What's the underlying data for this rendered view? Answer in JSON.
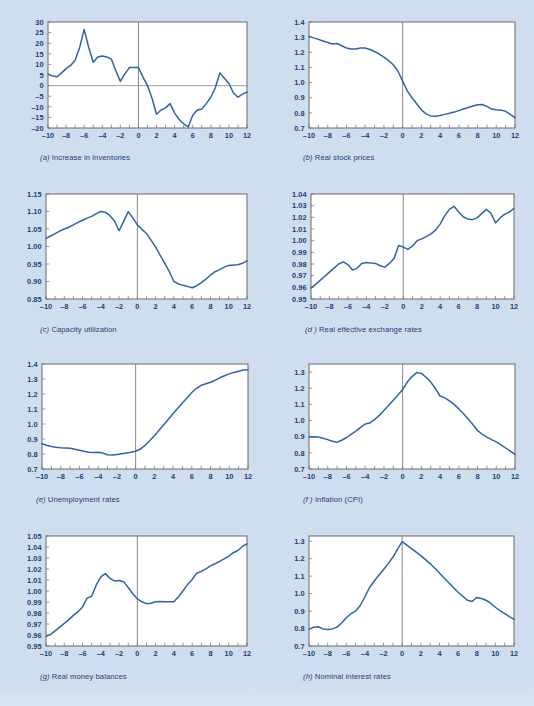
{
  "figure": {
    "background_color": "#cfdeee",
    "line_color": "#2f63ae",
    "axis_color": "#6b6b6b",
    "label_color": "#1b3f77",
    "panel_background": "#ffffff"
  },
  "chart_data": [
    {
      "type": "line",
      "panel": "a",
      "title": "Increase in inventories",
      "caption_prefix": "(a)",
      "xlabel": "",
      "ylabel": "",
      "xlim": [
        -10,
        12
      ],
      "ylim": [
        -20,
        30
      ],
      "xticks": [
        -10,
        -8,
        -6,
        -4,
        -2,
        0,
        2,
        4,
        6,
        8,
        10,
        12
      ],
      "xticklabels": [
        "–10",
        "–8",
        "–6",
        "–4",
        "–2",
        "0",
        "2",
        "4",
        "6",
        "8",
        "10",
        "12"
      ],
      "yticks": [
        -20,
        -15,
        -10,
        -5,
        0,
        5,
        10,
        15,
        20,
        25,
        30
      ],
      "yticklabels": [
        "–20",
        "–15",
        "–10",
        "–5",
        "0",
        "5",
        "10",
        "15",
        "20",
        "25",
        "30"
      ],
      "grid": false,
      "zero_line_x": 0,
      "zero_line_y": 0,
      "x": [
        -10,
        -9.5,
        -9,
        -8.5,
        -8,
        -7.5,
        -7,
        -6.5,
        -6,
        -5.5,
        -5,
        -4.5,
        -4,
        -3.5,
        -3,
        -2.5,
        -2,
        -1.5,
        -1,
        -0.5,
        0,
        0.5,
        1,
        1.5,
        2,
        2.5,
        3,
        3.5,
        4,
        4.5,
        5,
        5.5,
        6,
        6.5,
        7,
        7.5,
        8,
        8.5,
        9,
        9.5,
        10,
        10.5,
        11,
        11.5,
        12
      ],
      "values": [
        5.5,
        4.5,
        4.2,
        6.0,
        8.0,
        9.5,
        12.0,
        18.0,
        26.5,
        18.0,
        11.0,
        13.5,
        14.0,
        13.5,
        12.5,
        7.0,
        2.0,
        5.5,
        8.5,
        8.5,
        8.5,
        4.0,
        0.0,
        -6.0,
        -13.5,
        -11.5,
        -10.5,
        -8.5,
        -13.0,
        -16.0,
        -18.0,
        -19.5,
        -14.0,
        -11.5,
        -11.0,
        -8.5,
        -5.5,
        -1.0,
        6.0,
        3.5,
        1.0,
        -3.5,
        -5.5,
        -4.0,
        -3.0
      ]
    },
    {
      "type": "line",
      "panel": "b",
      "title": "Real stock prices",
      "caption_prefix": "(b)",
      "xlabel": "",
      "ylabel": "",
      "xlim": [
        -10,
        12
      ],
      "ylim": [
        0.7,
        1.4
      ],
      "xticks": [
        -10,
        -8,
        -6,
        -4,
        -2,
        0,
        2,
        4,
        6,
        8,
        10,
        12
      ],
      "xticklabels": [
        "–10",
        "–8",
        "–6",
        "–4",
        "–2",
        "0",
        "2",
        "4",
        "6",
        "8",
        "10",
        "12"
      ],
      "yticks": [
        0.7,
        0.8,
        0.9,
        1.0,
        1.1,
        1.2,
        1.3,
        1.4
      ],
      "yticklabels": [
        "0.7",
        "0.8",
        "0.9",
        "1.0",
        "1.1",
        "1.2",
        "1.3",
        "1.4"
      ],
      "grid": false,
      "zero_line_x": 0,
      "x": [
        -10,
        -9.5,
        -9,
        -8.5,
        -8,
        -7.5,
        -7,
        -6.5,
        -6,
        -5.5,
        -5,
        -4.5,
        -4,
        -3.5,
        -3,
        -2.5,
        -2,
        -1.5,
        -1,
        -0.5,
        0,
        0.5,
        1,
        1.5,
        2,
        2.5,
        3,
        3.5,
        4,
        4.5,
        5,
        5.5,
        6,
        6.5,
        7,
        7.5,
        8,
        8.5,
        9,
        9.5,
        10,
        10.5,
        11,
        11.5,
        12
      ],
      "values": [
        1.305,
        1.295,
        1.285,
        1.275,
        1.265,
        1.255,
        1.258,
        1.243,
        1.228,
        1.222,
        1.222,
        1.228,
        1.228,
        1.218,
        1.205,
        1.188,
        1.168,
        1.145,
        1.118,
        1.075,
        1.01,
        0.945,
        0.9,
        0.86,
        0.82,
        0.793,
        0.78,
        0.777,
        0.783,
        0.79,
        0.797,
        0.805,
        0.815,
        0.825,
        0.835,
        0.845,
        0.853,
        0.855,
        0.843,
        0.825,
        0.82,
        0.818,
        0.81,
        0.79,
        0.768
      ]
    },
    {
      "type": "line",
      "panel": "c",
      "title": "Capacity utilization",
      "caption_prefix": "(c)",
      "xlabel": "",
      "ylabel": "",
      "xlim": [
        -10,
        12
      ],
      "ylim": [
        0.85,
        1.15
      ],
      "xticks": [
        -10,
        -8,
        -6,
        -4,
        -2,
        0,
        2,
        4,
        6,
        8,
        10,
        12
      ],
      "xticklabels": [
        "–10",
        "–8",
        "–6",
        "–4",
        "–2",
        "0",
        "2",
        "4",
        "6",
        "8",
        "10",
        "12"
      ],
      "yticks": [
        0.85,
        0.9,
        0.95,
        1.0,
        1.05,
        1.1,
        1.15
      ],
      "yticklabels": [
        "0.85",
        "0.90",
        "0.95",
        "1.00",
        "1.05",
        "1.10",
        "1.15"
      ],
      "grid": false,
      "zero_line_x": 0,
      "x": [
        -10,
        -9.5,
        -9,
        -8.5,
        -8,
        -7.5,
        -7,
        -6.5,
        -6,
        -5.5,
        -5,
        -4.5,
        -4,
        -3.5,
        -3,
        -2.5,
        -2,
        -1.5,
        -1,
        -0.5,
        0,
        0.5,
        1,
        1.5,
        2,
        2.5,
        3,
        3.5,
        4,
        4.5,
        5,
        5.5,
        6,
        6.5,
        7,
        7.5,
        8,
        8.5,
        9,
        9.5,
        10,
        10.5,
        11,
        11.5,
        12
      ],
      "values": [
        1.023,
        1.03,
        1.037,
        1.044,
        1.05,
        1.055,
        1.062,
        1.069,
        1.075,
        1.081,
        1.086,
        1.094,
        1.1,
        1.098,
        1.088,
        1.073,
        1.045,
        1.072,
        1.0995,
        1.082,
        1.062,
        1.049,
        1.037,
        1.018,
        0.998,
        0.975,
        0.952,
        0.928,
        0.9,
        0.893,
        0.889,
        0.886,
        0.882,
        0.888,
        0.897,
        0.907,
        0.918,
        0.928,
        0.934,
        0.941,
        0.946,
        0.947,
        0.948,
        0.952,
        0.959
      ]
    },
    {
      "type": "line",
      "panel": "d",
      "title": "Real effective exchange rates",
      "caption_prefix": "(d )",
      "xlabel": "",
      "ylabel": "",
      "xlim": [
        -10,
        12
      ],
      "ylim": [
        0.95,
        1.04
      ],
      "xticks": [
        -10,
        -8,
        -6,
        -4,
        -2,
        0,
        2,
        4,
        6,
        8,
        10,
        12
      ],
      "xticklabels": [
        "–10",
        "–8",
        "–6",
        "–4",
        "–2",
        "0",
        "2",
        "4",
        "6",
        "8",
        "10",
        "12"
      ],
      "yticks": [
        0.95,
        0.96,
        0.97,
        0.98,
        0.99,
        1.0,
        1.01,
        1.02,
        1.03,
        1.04
      ],
      "yticklabels": [
        "0.95",
        "0.96",
        "0.97",
        "0.98",
        "0.99",
        "1.00",
        "1.01",
        "1.02",
        "1.03",
        "1.04"
      ],
      "grid": false,
      "zero_line_x": 0,
      "x": [
        -10,
        -9.5,
        -9,
        -8.5,
        -8,
        -7.5,
        -7,
        -6.5,
        -6,
        -5.5,
        -5,
        -4.5,
        -4,
        -3.5,
        -3,
        -2.5,
        -2,
        -1.5,
        -1,
        -0.5,
        0,
        0.5,
        1,
        1.5,
        2,
        2.5,
        3,
        3.5,
        4,
        4.5,
        5,
        5.5,
        6,
        6.5,
        7,
        7.5,
        8,
        8.5,
        9,
        9.5,
        10,
        10.5,
        11,
        11.5,
        12
      ],
      "values": [
        0.9595,
        0.9625,
        0.966,
        0.9695,
        0.973,
        0.9765,
        0.98,
        0.9818,
        0.9795,
        0.9748,
        0.9765,
        0.9805,
        0.9812,
        0.9808,
        0.9805,
        0.9785,
        0.9773,
        0.9805,
        0.9848,
        0.9958,
        0.9945,
        0.9925,
        0.9955,
        1.0,
        1.0015,
        1.0035,
        1.0058,
        1.009,
        1.0142,
        1.0215,
        1.0268,
        1.0295,
        1.0245,
        1.0205,
        1.0185,
        1.018,
        1.0195,
        1.0232,
        1.0268,
        1.0235,
        1.0152,
        1.0195,
        1.0228,
        1.0245,
        1.0278
      ]
    },
    {
      "type": "line",
      "panel": "e",
      "title": "Unemployment rates",
      "caption_prefix": "(e)",
      "xlabel": "",
      "ylabel": "",
      "xlim": [
        -10,
        12
      ],
      "ylim": [
        0.7,
        1.4
      ],
      "xticks": [
        -10,
        -8,
        -6,
        -4,
        -2,
        0,
        2,
        4,
        6,
        8,
        10,
        12
      ],
      "xticklabels": [
        "–10",
        "–8",
        "–6",
        "–4",
        "–2",
        "0",
        "2",
        "4",
        "6",
        "8",
        "10",
        "12"
      ],
      "yticks": [
        0.7,
        0.8,
        0.9,
        1.0,
        1.1,
        1.2,
        1.3,
        1.4
      ],
      "yticklabels": [
        "0.7",
        "0.8",
        "0.9",
        "1.0",
        "1.1",
        "1.2",
        "1.3",
        "1.4"
      ],
      "grid": false,
      "zero_line_x": 0,
      "x": [
        -10,
        -9.5,
        -9,
        -8.5,
        -8,
        -7.5,
        -7,
        -6.5,
        -6,
        -5.5,
        -5,
        -4.5,
        -4,
        -3.5,
        -3,
        -2.5,
        -2,
        -1.5,
        -1,
        -0.5,
        0,
        0.5,
        1,
        1.5,
        2,
        2.5,
        3,
        3.5,
        4,
        4.5,
        5,
        5.5,
        6,
        6.5,
        7,
        7.5,
        8,
        8.5,
        9,
        9.5,
        10,
        10.5,
        11,
        11.5,
        12
      ],
      "values": [
        0.868,
        0.858,
        0.85,
        0.845,
        0.842,
        0.84,
        0.838,
        0.832,
        0.825,
        0.818,
        0.812,
        0.81,
        0.812,
        0.806,
        0.795,
        0.793,
        0.797,
        0.802,
        0.807,
        0.812,
        0.818,
        0.833,
        0.858,
        0.888,
        0.922,
        0.958,
        0.995,
        1.032,
        1.07,
        1.105,
        1.14,
        1.175,
        1.21,
        1.238,
        1.258,
        1.268,
        1.278,
        1.292,
        1.308,
        1.322,
        1.334,
        1.344,
        1.352,
        1.36,
        1.362
      ]
    },
    {
      "type": "line",
      "panel": "f",
      "title": "Inflation (CPI)",
      "caption_prefix": "(f )",
      "xlabel": "",
      "ylabel": "",
      "xlim": [
        -10,
        12
      ],
      "ylim": [
        0.7,
        1.35
      ],
      "xticks": [
        -10,
        -8,
        -6,
        -4,
        -2,
        0,
        2,
        4,
        6,
        8,
        10,
        12
      ],
      "xticklabels": [
        "–10",
        "–8",
        "–6",
        "–4",
        "–2",
        "0",
        "2",
        "4",
        "6",
        "8",
        "10",
        "12"
      ],
      "yticks": [
        0.7,
        0.8,
        0.9,
        1.0,
        1.1,
        1.2,
        1.3
      ],
      "yticklabels": [
        "0.7",
        "0.8",
        "0.9",
        "1.0",
        "1.1",
        "1.2",
        "1.3"
      ],
      "grid": false,
      "zero_line_x": 0,
      "x": [
        -10,
        -9.5,
        -9,
        -8.5,
        -8,
        -7.5,
        -7,
        -6.5,
        -6,
        -5.5,
        -5,
        -4.5,
        -4,
        -3.5,
        -3,
        -2.5,
        -2,
        -1.5,
        -1,
        -0.5,
        0,
        0.5,
        1,
        1.5,
        2,
        2.5,
        3,
        3.5,
        4,
        4.5,
        5,
        5.5,
        6,
        6.5,
        7,
        7.5,
        8,
        8.5,
        9,
        9.5,
        10,
        10.5,
        11,
        11.5,
        12
      ],
      "values": [
        0.898,
        0.9,
        0.898,
        0.89,
        0.882,
        0.872,
        0.866,
        0.878,
        0.895,
        0.915,
        0.935,
        0.958,
        0.978,
        0.985,
        1.005,
        1.032,
        1.062,
        1.093,
        1.125,
        1.158,
        1.192,
        1.238,
        1.272,
        1.297,
        1.292,
        1.268,
        1.238,
        1.198,
        1.152,
        1.14,
        1.122,
        1.1,
        1.072,
        1.042,
        1.01,
        0.975,
        0.938,
        0.915,
        0.897,
        0.882,
        0.868,
        0.85,
        0.83,
        0.81,
        0.79
      ]
    },
    {
      "type": "line",
      "panel": "g",
      "title": "Real money balances",
      "caption_prefix": "(g)",
      "xlabel": "",
      "ylabel": "",
      "xlim": [
        -10,
        12
      ],
      "ylim": [
        0.95,
        1.05
      ],
      "xticks": [
        -10,
        -8,
        -6,
        -4,
        -2,
        0,
        2,
        4,
        6,
        8,
        10,
        12
      ],
      "xticklabels": [
        "–10",
        "–8",
        "–6",
        "–4",
        "–2",
        "0",
        "2",
        "4",
        "6",
        "8",
        "10",
        "12"
      ],
      "yticks": [
        0.95,
        0.96,
        0.97,
        0.98,
        0.99,
        1.0,
        1.01,
        1.02,
        1.03,
        1.04,
        1.05
      ],
      "yticklabels": [
        "0.95",
        "0.96",
        "0.97",
        "0.98",
        "0.99",
        "1.00",
        "1.01",
        "1.02",
        "1.03",
        "1.04",
        "1.05"
      ],
      "grid": false,
      "zero_line_x": 0,
      "x": [
        -10,
        -9.5,
        -9,
        -8.5,
        -8,
        -7.5,
        -7,
        -6.5,
        -6,
        -5.5,
        -5,
        -4.5,
        -4,
        -3.5,
        -3,
        -2.5,
        -2,
        -1.5,
        -1,
        -0.5,
        0,
        0.5,
        1,
        1.5,
        2,
        2.5,
        3,
        3.5,
        4,
        4.5,
        5,
        5.5,
        6,
        6.5,
        7,
        7.5,
        8,
        8.5,
        9,
        9.5,
        10,
        10.5,
        11,
        11.5,
        12
      ],
      "values": [
        0.9588,
        0.9605,
        0.9638,
        0.9672,
        0.9705,
        0.974,
        0.9778,
        0.9812,
        0.9855,
        0.9935,
        0.9952,
        1.0055,
        1.0128,
        1.0158,
        1.0115,
        1.0092,
        1.0095,
        1.0085,
        1.0032,
        0.9975,
        0.9928,
        0.9902,
        0.9885,
        0.9888,
        0.9902,
        0.9905,
        0.9902,
        0.9902,
        0.9902,
        0.9948,
        1.0002,
        1.0058,
        1.0105,
        1.0162,
        1.0178,
        1.0202,
        1.0228,
        1.0248,
        1.027,
        1.0292,
        1.0318,
        1.0348,
        1.0368,
        1.0405,
        1.0428
      ]
    },
    {
      "type": "line",
      "panel": "h",
      "title": "Nominal interest rates",
      "caption_prefix": "(h)",
      "xlabel": "",
      "ylabel": "",
      "xlim": [
        -10,
        12
      ],
      "ylim": [
        0.7,
        1.33
      ],
      "xticks": [
        -10,
        -8,
        -6,
        -4,
        -2,
        0,
        2,
        4,
        6,
        8,
        10,
        12
      ],
      "xticklabels": [
        "–10",
        "–8",
        "–6",
        "–4",
        "–2",
        "0",
        "2",
        "4",
        "6",
        "8",
        "10",
        "12"
      ],
      "yticks": [
        0.7,
        0.8,
        0.9,
        1.0,
        1.1,
        1.2,
        1.3
      ],
      "yticklabels": [
        "0.7",
        "0.8",
        "0.9",
        "1.0",
        "1.1",
        "1.2",
        "1.3"
      ],
      "grid": false,
      "zero_line_x": 0,
      "x": [
        -10,
        -9.5,
        -9,
        -8.5,
        -8,
        -7.5,
        -7,
        -6.5,
        -6,
        -5.5,
        -5,
        -4.5,
        -4,
        -3.5,
        -3,
        -2.5,
        -2,
        -1.5,
        -1,
        -0.5,
        0,
        0.5,
        1,
        1.5,
        2,
        2.5,
        3,
        3.5,
        4,
        4.5,
        5,
        5.5,
        6,
        6.5,
        7,
        7.5,
        8,
        8.5,
        9,
        9.5,
        10,
        10.5,
        11,
        11.5,
        12
      ],
      "values": [
        0.795,
        0.808,
        0.81,
        0.798,
        0.795,
        0.798,
        0.808,
        0.832,
        0.862,
        0.885,
        0.9,
        0.932,
        0.982,
        1.035,
        1.072,
        1.105,
        1.138,
        1.172,
        1.208,
        1.255,
        1.298,
        1.278,
        1.258,
        1.238,
        1.218,
        1.195,
        1.172,
        1.145,
        1.118,
        1.09,
        1.062,
        1.035,
        1.008,
        0.985,
        0.962,
        0.955,
        0.978,
        0.972,
        0.962,
        0.945,
        0.922,
        0.902,
        0.885,
        0.868,
        0.852
      ]
    }
  ]
}
